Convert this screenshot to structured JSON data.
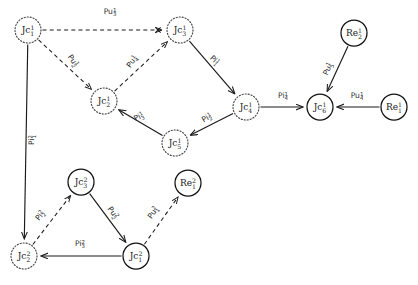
{
  "figure": {
    "type": "directed-graph",
    "width": 418,
    "height": 285,
    "background": "#ffffff",
    "stroke_color": "#1a1a1a"
  },
  "nodes": [
    {
      "id": "Jc1_1",
      "label": "Jc",
      "sub": "1",
      "sup": "1",
      "style": "dotted",
      "shape": "circle",
      "x": 28,
      "y": 30,
      "r": 13
    },
    {
      "id": "Jc3_1",
      "label": "Jc",
      "sub": "3",
      "sup": "1",
      "style": "dotted",
      "shape": "circle",
      "x": 180,
      "y": 30,
      "r": 13
    },
    {
      "id": "Jc2_1",
      "label": "Jc",
      "sub": "2",
      "sup": "1",
      "style": "dotted",
      "shape": "circle",
      "x": 104,
      "y": 101,
      "r": 13
    },
    {
      "id": "Jc5_1",
      "label": "Jc",
      "sub": "5",
      "sup": "1",
      "style": "dotted",
      "shape": "circle",
      "x": 175,
      "y": 143,
      "r": 13
    },
    {
      "id": "Jc4_1",
      "label": "Jc",
      "sub": "4",
      "sup": "1",
      "style": "dotted",
      "shape": "circle",
      "x": 246,
      "y": 107,
      "r": 13
    },
    {
      "id": "Jc6_1",
      "label": "Jc",
      "sub": "6",
      "sup": "1",
      "style": "solid",
      "shape": "circle",
      "x": 320,
      "y": 107,
      "r": 13
    },
    {
      "id": "Re2_1",
      "label": "Re",
      "sub": "2",
      "sup": "1",
      "style": "solid",
      "shape": "circle",
      "x": 354,
      "y": 33,
      "r": 13
    },
    {
      "id": "Re1_1",
      "label": "Re",
      "sub": "1",
      "sup": "1",
      "style": "solid",
      "shape": "circle",
      "x": 394,
      "y": 107,
      "r": 13
    },
    {
      "id": "Jc3_2",
      "label": "Jc",
      "sub": "3",
      "sup": "2",
      "style": "solid",
      "shape": "circle",
      "x": 81,
      "y": 182,
      "r": 13
    },
    {
      "id": "Jc2_2",
      "label": "Jc",
      "sub": "2",
      "sup": "2",
      "style": "dotted",
      "shape": "circle",
      "x": 24,
      "y": 256,
      "r": 13
    },
    {
      "id": "Jc1_2",
      "label": "Jc",
      "sub": "1",
      "sup": "2",
      "style": "solid",
      "shape": "circle",
      "x": 136,
      "y": 256,
      "r": 13
    },
    {
      "id": "Re1_2",
      "label": "Re",
      "sub": "1",
      "sup": "2",
      "style": "solid",
      "shape": "circle",
      "x": 188,
      "y": 183,
      "r": 13
    }
  ],
  "edges": [
    {
      "id": "e_pu3_1",
      "from": "Jc1_1",
      "to": "Jc3_1",
      "style": "dashed",
      "arrow": "cross",
      "label": "Pu",
      "sub": "3",
      "sup": "1",
      "lx": 110,
      "ly": 14,
      "rot": 0
    },
    {
      "id": "e_pu2_1",
      "from": "Jc1_1",
      "to": "Jc2_1",
      "style": "dashed",
      "arrow": "normal",
      "label": "Pu",
      "sub": "2",
      "sup": "1",
      "lx": 71,
      "ly": 62,
      "rot": 56
    },
    {
      "id": "e_pu4_1",
      "from": "Jc2_1",
      "to": "Jc3_1",
      "style": "dashed",
      "arrow": "normal",
      "label": "Pu",
      "sub": "4",
      "sup": "1",
      "lx": 134,
      "ly": 63,
      "rot": -54
    },
    {
      "id": "e_pi1_1",
      "from": "Jc3_1",
      "to": "Jc4_1",
      "style": "solid",
      "arrow": "normal",
      "label": "Pi",
      "sub": "1",
      "sup": "1",
      "lx": 213,
      "ly": 62,
      "rot": 44
    },
    {
      "id": "e_pi2_1",
      "from": "Jc4_1",
      "to": "Jc5_1",
      "style": "solid",
      "arrow": "normal",
      "label": "Pi",
      "sub": "2",
      "sup": "1",
      "lx": 208,
      "ly": 120,
      "rot": -29
    },
    {
      "id": "e_pi3_1",
      "from": "Jc5_1",
      "to": "Jc2_1",
      "style": "solid",
      "arrow": "normal",
      "label": "Pi",
      "sub": "3",
      "sup": "1",
      "lx": 140,
      "ly": 119,
      "rot": -28
    },
    {
      "id": "e_pi4_1",
      "from": "Jc4_1",
      "to": "Jc6_1",
      "style": "solid",
      "arrow": "normal",
      "label": "Pi",
      "sub": "4",
      "sup": "1",
      "lx": 283,
      "ly": 98,
      "rot": 0
    },
    {
      "id": "e_pu5_1",
      "from": "Re2_1",
      "to": "Jc6_1",
      "style": "solid",
      "arrow": "normal",
      "label": "Pu",
      "sub": "5",
      "sup": "1",
      "lx": 330,
      "ly": 70,
      "rot": -66
    },
    {
      "id": "e_pu4r_1",
      "from": "Re1_1",
      "to": "Jc6_1",
      "style": "solid",
      "arrow": "normal",
      "label": "Pu",
      "sub": "4",
      "sup": "1",
      "lx": 357,
      "ly": 98,
      "rot": 0
    },
    {
      "id": "e_pi1_2",
      "from": "Jc1_1",
      "to": "Jc2_2",
      "style": "solid",
      "arrow": "normal",
      "label": "Pi",
      "sub": "1",
      "sup": "2",
      "lx": 34,
      "ly": 140,
      "rot": -90
    },
    {
      "id": "e_pi2_2",
      "from": "Jc2_2",
      "to": "Jc3_2",
      "style": "dashed",
      "arrow": "normal",
      "label": "Pi",
      "sub": "2",
      "sup": "2",
      "lx": 42,
      "ly": 217,
      "rot": -53
    },
    {
      "id": "e_pu2_2",
      "from": "Jc3_2",
      "to": "Jc1_2",
      "style": "solid",
      "arrow": "normal",
      "label": "Pu",
      "sub": "2",
      "sup": "2",
      "lx": 111,
      "ly": 214,
      "rot": 55
    },
    {
      "id": "e_pi3_2",
      "from": "Jc1_2",
      "to": "Jc2_2",
      "style": "solid",
      "arrow": "normal",
      "label": "Pi",
      "sub": "3",
      "sup": "2",
      "lx": 80,
      "ly": 246,
      "rot": 0
    },
    {
      "id": "e_pu1_2",
      "from": "Jc1_2",
      "to": "Re1_2",
      "style": "dashed",
      "arrow": "normal",
      "label": "Pu",
      "sub": "1",
      "sup": "2",
      "lx": 155,
      "ly": 214,
      "rot": -56
    }
  ],
  "legend": {
    "solid_node_meaning": "solid circle node",
    "dotted_node_meaning": "dotted circle node",
    "cross_arrow_meaning": "crossed arrowhead"
  }
}
